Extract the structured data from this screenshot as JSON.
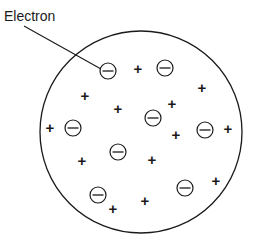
{
  "diagram": {
    "background_color": "#ffffff",
    "stroke_color": "#1a1a1a",
    "annotation": {
      "label": "Electron",
      "label_x": 4,
      "label_y": 21,
      "leader_line": {
        "x1": 24,
        "y1": 26,
        "x2": 101,
        "y2": 69
      }
    },
    "sphere": {
      "name": "positive-charge-sphere",
      "cx": 141,
      "cy": 132,
      "r": 101
    },
    "electron_symbol": "⊖",
    "positive_symbol": "+",
    "electrons": [
      {
        "id": "electron-1",
        "cx": 108,
        "cy": 71,
        "r": 8
      },
      {
        "id": "electron-2",
        "cx": 165,
        "cy": 68,
        "r": 8
      },
      {
        "id": "electron-3",
        "cx": 153,
        "cy": 118,
        "r": 8
      },
      {
        "id": "electron-4",
        "cx": 73,
        "cy": 128,
        "r": 8
      },
      {
        "id": "electron-5",
        "cx": 205,
        "cy": 130,
        "r": 8
      },
      {
        "id": "electron-6",
        "cx": 118,
        "cy": 152,
        "r": 8
      },
      {
        "id": "electron-7",
        "cx": 98,
        "cy": 195,
        "r": 8
      },
      {
        "id": "electron-8",
        "cx": 185,
        "cy": 188,
        "r": 8
      }
    ],
    "positive_charges": [
      {
        "id": "plus-1",
        "x": 138,
        "y": 68
      },
      {
        "id": "plus-2",
        "x": 202,
        "y": 87
      },
      {
        "id": "plus-3",
        "x": 85,
        "y": 95
      },
      {
        "id": "plus-4",
        "x": 118,
        "y": 108
      },
      {
        "id": "plus-5",
        "x": 172,
        "y": 103
      },
      {
        "id": "plus-6",
        "x": 50,
        "y": 127
      },
      {
        "id": "plus-7",
        "x": 176,
        "y": 134
      },
      {
        "id": "plus-8",
        "x": 228,
        "y": 128
      },
      {
        "id": "plus-9",
        "x": 82,
        "y": 160
      },
      {
        "id": "plus-10",
        "x": 152,
        "y": 159
      },
      {
        "id": "plus-11",
        "x": 216,
        "y": 180
      },
      {
        "id": "plus-12",
        "x": 113,
        "y": 208
      },
      {
        "id": "plus-13",
        "x": 145,
        "y": 200
      }
    ]
  }
}
